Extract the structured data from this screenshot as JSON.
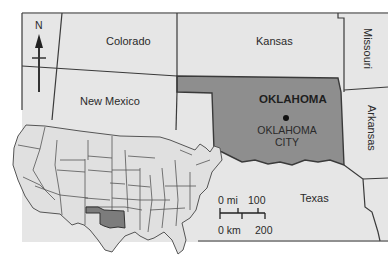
{
  "map": {
    "title": "Oklahoma",
    "colors": {
      "background": "#ffffff",
      "state_fill": "#e4e4e4",
      "highlight_fill": "#8a8a8a",
      "border": "#3a3a3a"
    },
    "states": {
      "colorado": "Colorado",
      "kansas": "Kansas",
      "missouri": "Missouri",
      "new_mexico": "New Mexico",
      "oklahoma": "OKLAHOMA",
      "arkansas": "Arkansas",
      "texas": "Texas"
    },
    "capital": {
      "line1": "OKLAHOMA",
      "line2": "CITY"
    },
    "north_arrow": {
      "label": "N",
      "icon": "north-arrow-icon"
    },
    "scale_bar": {
      "mi_start": "0 mi",
      "mi_end": "100",
      "km_start": "0 km",
      "km_end": "200"
    },
    "inset": {
      "description": "Locator map of the contiguous United States with Oklahoma highlighted"
    }
  }
}
